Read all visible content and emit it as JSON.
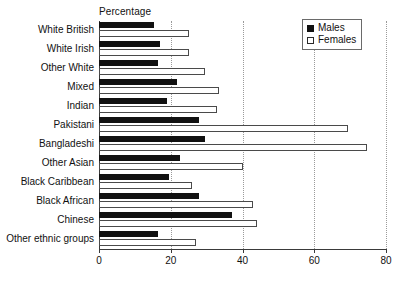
{
  "chart_data": {
    "type": "bar",
    "orientation": "horizontal",
    "title": "",
    "xlabel": "Percentage",
    "ylabel": "",
    "xlim": [
      0,
      80
    ],
    "xticks": [
      0,
      20,
      40,
      60,
      80
    ],
    "grid": true,
    "legend_position": "top-right",
    "categories": [
      "White British",
      "White Irish",
      "Other White",
      "Mixed",
      "Indian",
      "Pakistani",
      "Bangladeshi",
      "Other Asian",
      "Black Caribbean",
      "Black African",
      "Chinese",
      "Other ethnic groups"
    ],
    "series": [
      {
        "name": "Males",
        "color": "#111111",
        "values": [
          15.3,
          17.0,
          16.4,
          21.7,
          19.0,
          28.0,
          29.5,
          22.5,
          19.5,
          27.8,
          37.0,
          16.5
        ]
      },
      {
        "name": "Females",
        "color": "#ffffff",
        "values": [
          25.0,
          25.0,
          29.5,
          33.5,
          33.0,
          69.5,
          74.6,
          40.0,
          25.8,
          43.0,
          44.0,
          27.0
        ]
      }
    ]
  },
  "legend": {
    "items": [
      {
        "label": "Males"
      },
      {
        "label": "Females"
      }
    ]
  }
}
